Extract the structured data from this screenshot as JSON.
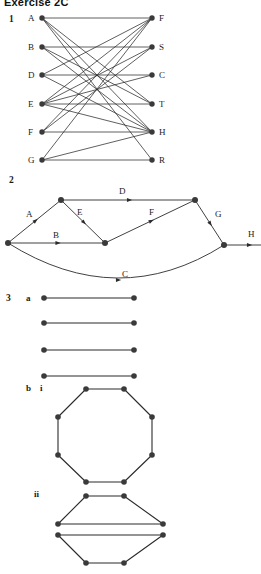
{
  "title": "Exercise 2C",
  "questions": {
    "q1": "1",
    "q2": "2",
    "q3": "3",
    "part_a": "a",
    "part_b": "b",
    "part_i": "i",
    "part_ii": "ii"
  },
  "colors": {
    "ink": "#1b1b1b",
    "node": "#3a3a3a",
    "edge": "#2b2b2b",
    "background": "#ffffff"
  },
  "q1_graph": {
    "type": "bipartite-graph",
    "left_labels": [
      "A",
      "B",
      "D",
      "E",
      "F",
      "G"
    ],
    "right_labels": [
      "F",
      "S",
      "C",
      "T",
      "H",
      "R"
    ],
    "left_nodes": [
      {
        "id": "A",
        "x": 42,
        "y": 18
      },
      {
        "id": "B",
        "x": 42,
        "y": 47
      },
      {
        "id": "D",
        "x": 42,
        "y": 75
      },
      {
        "id": "E",
        "x": 42,
        "y": 104
      },
      {
        "id": "F",
        "x": 42,
        "y": 132
      },
      {
        "id": "G",
        "x": 42,
        "y": 160
      }
    ],
    "right_nodes": [
      {
        "id": "F",
        "x": 152,
        "y": 18
      },
      {
        "id": "S",
        "x": 152,
        "y": 47
      },
      {
        "id": "C",
        "x": 152,
        "y": 75
      },
      {
        "id": "T",
        "x": 152,
        "y": 104
      },
      {
        "id": "H",
        "x": 152,
        "y": 132
      },
      {
        "id": "R",
        "x": 152,
        "y": 160
      }
    ],
    "edges": [
      [
        "A",
        "F"
      ],
      [
        "A",
        "T"
      ],
      [
        "A",
        "H"
      ],
      [
        "A",
        "R"
      ],
      [
        "B",
        "S"
      ],
      [
        "B",
        "T"
      ],
      [
        "B",
        "H"
      ],
      [
        "D",
        "C"
      ],
      [
        "D",
        "H"
      ],
      [
        "D",
        "F"
      ],
      [
        "E",
        "T"
      ],
      [
        "E",
        "F"
      ],
      [
        "E",
        "S"
      ],
      [
        "E",
        "C"
      ],
      [
        "E",
        "H"
      ],
      [
        "F",
        "H"
      ],
      [
        "F",
        "F"
      ],
      [
        "F",
        "S"
      ],
      [
        "G",
        "F"
      ],
      [
        "G",
        "H"
      ],
      [
        "G",
        "R"
      ]
    ]
  },
  "q2_graph": {
    "type": "directed-network",
    "edge_labels": [
      "A",
      "B",
      "C",
      "D",
      "E",
      "F",
      "G",
      "H"
    ],
    "nodes": [
      {
        "id": "n0",
        "x": 8,
        "y": 243
      },
      {
        "id": "n1",
        "x": 61,
        "y": 200
      },
      {
        "id": "n2",
        "x": 105,
        "y": 243
      },
      {
        "id": "n3",
        "x": 195,
        "y": 200
      },
      {
        "id": "n4",
        "x": 224,
        "y": 245
      }
    ],
    "labels": [
      {
        "text": "A",
        "x": 26,
        "y": 217
      },
      {
        "text": "B",
        "x": 53,
        "y": 238
      },
      {
        "text": "C",
        "x": 122,
        "y": 277
      },
      {
        "text": "D",
        "x": 119,
        "y": 194
      },
      {
        "text": "E",
        "x": 77,
        "y": 215
      },
      {
        "text": "F",
        "x": 149,
        "y": 215
      },
      {
        "text": "G",
        "x": 215,
        "y": 217
      },
      {
        "text": "H",
        "x": 248,
        "y": 237
      }
    ]
  },
  "q3a_graph": {
    "type": "parallel-segments",
    "segments": [
      {
        "x1": 44,
        "y1": 298,
        "x2": 134,
        "y2": 298
      },
      {
        "x1": 44,
        "y1": 323,
        "x2": 134,
        "y2": 323
      },
      {
        "x1": 44,
        "y1": 350,
        "x2": 134,
        "y2": 350
      },
      {
        "x1": 44,
        "y1": 376,
        "x2": 134,
        "y2": 376
      }
    ]
  },
  "q3bi_graph": {
    "type": "octagon",
    "vertices": [
      {
        "x": 86,
        "y": 389
      },
      {
        "x": 124,
        "y": 389
      },
      {
        "x": 152,
        "y": 417
      },
      {
        "x": 152,
        "y": 455
      },
      {
        "x": 124,
        "y": 482
      },
      {
        "x": 86,
        "y": 482
      },
      {
        "x": 58,
        "y": 455
      },
      {
        "x": 58,
        "y": 417
      }
    ]
  },
  "q3bii_graph": {
    "type": "two-trapezoids",
    "top_trapezoid": [
      {
        "x": 86,
        "y": 496
      },
      {
        "x": 124,
        "y": 496
      },
      {
        "x": 163,
        "y": 524
      },
      {
        "x": 58,
        "y": 524
      }
    ],
    "bottom_trapezoid": [
      {
        "x": 58,
        "y": 535
      },
      {
        "x": 163,
        "y": 535
      },
      {
        "x": 124,
        "y": 563
      },
      {
        "x": 86,
        "y": 563
      }
    ]
  }
}
